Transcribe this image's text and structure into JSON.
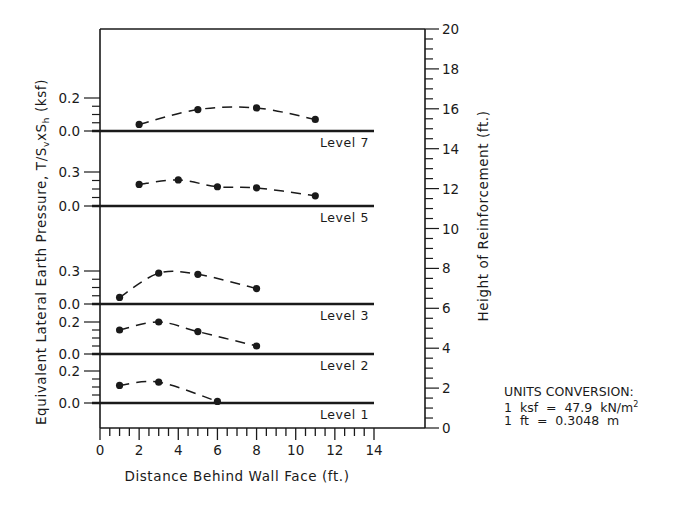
{
  "chart_data": {
    "type": "line",
    "title": "",
    "xlabel": "Distance Behind Wall Face (ft.)",
    "ylabel_left": "Equivalent Lateral Earth Pressure, T/SvxSh (ksf)",
    "ylabel_right": "Height of Reinforcement (ft.)",
    "xlim": [
      0,
      14
    ],
    "x_ticks": [
      0,
      2,
      4,
      6,
      8,
      10,
      12,
      14
    ],
    "right_ylim": [
      0,
      20
    ],
    "right_y_ticks": [
      0,
      2,
      4,
      6,
      8,
      10,
      12,
      14,
      16,
      18,
      20
    ],
    "grid": false,
    "line_style": "dashed with filled circle markers",
    "series": [
      {
        "name": "Level 7",
        "baseline_height_ft": 15,
        "left_ticks": [
          "0.0",
          "0.2"
        ],
        "x": [
          2,
          5,
          8,
          11
        ],
        "values": [
          0.04,
          0.13,
          0.14,
          0.07
        ]
      },
      {
        "name": "Level 5",
        "baseline_height_ft": 11.2,
        "left_ticks": [
          "0.0",
          "0.3"
        ],
        "x": [
          2,
          4,
          6,
          8,
          11
        ],
        "values": [
          0.19,
          0.23,
          0.17,
          0.16,
          0.09
        ]
      },
      {
        "name": "Level 3",
        "baseline_height_ft": 6.2,
        "left_ticks": [
          "0.0",
          "0.3"
        ],
        "x": [
          1,
          3,
          5,
          8
        ],
        "values": [
          0.06,
          0.28,
          0.27,
          0.14
        ]
      },
      {
        "name": "Level 2",
        "baseline_height_ft": 3.7,
        "left_ticks": [
          "0.0",
          "0.2"
        ],
        "x": [
          1,
          3,
          5,
          8
        ],
        "values": [
          0.15,
          0.2,
          0.14,
          0.05
        ]
      },
      {
        "name": "Level 1",
        "baseline_height_ft": 1.25,
        "left_ticks": [
          "0.0",
          "0.2"
        ],
        "x": [
          1,
          3,
          6
        ],
        "values": [
          0.11,
          0.13,
          0.01
        ]
      }
    ]
  },
  "labels": {
    "xlabel": "Distance Behind Wall Face (ft.)",
    "ylabel_left_main": "Equivalent Lateral Earth Pressure, T/S",
    "ylabel_left_sub1": "v",
    "ylabel_left_mid": "xS",
    "ylabel_left_sub2": "h",
    "ylabel_left_end": " (ksf)",
    "ylabel_right": "Height of Reinforcement (ft.)"
  },
  "units": {
    "title": "UNITS CONVERSION:",
    "line1": "1  ksf  =  47.9  kN/m",
    "line1_sup": "2",
    "line2": "1  ft  =  0.3048  m"
  },
  "colors": {
    "ink": "#1a1a1a",
    "background": "#ffffff"
  }
}
